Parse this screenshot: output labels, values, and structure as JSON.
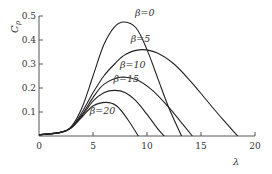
{
  "chart_data": {
    "type": "line",
    "title": "",
    "xlabel": "λ",
    "ylabel": "Cp",
    "ylabel_main": "C",
    "ylabel_sub": "p",
    "xlim": [
      0,
      20
    ],
    "ylim": [
      0,
      0.5
    ],
    "grid": false,
    "legend": "inline labels",
    "x_ticks": [
      0,
      5,
      10,
      15,
      20
    ],
    "x_tick_labels": [
      "0",
      "5",
      "10",
      "15",
      "20"
    ],
    "y_ticks": [
      0.1,
      0.2,
      0.3,
      0.4,
      0.5
    ],
    "y_tick_labels": [
      "0.1",
      "0.2",
      "0.3",
      "0.4",
      "0.5"
    ],
    "series": [
      {
        "name": "β=0",
        "label_pos": [
          8.9,
          0.5
        ],
        "x": [
          0,
          2,
          3,
          4,
          5,
          6,
          7,
          7.9,
          9,
          10,
          11,
          12,
          13.2
        ],
        "y": [
          0.005,
          0.015,
          0.04,
          0.12,
          0.25,
          0.38,
          0.455,
          0.475,
          0.45,
          0.36,
          0.24,
          0.12,
          0
        ]
      },
      {
        "name": "β=5",
        "label_pos": [
          8.5,
          0.39
        ],
        "x": [
          0,
          2,
          3,
          4,
          5,
          6,
          7,
          8,
          9.5,
          11,
          12.5,
          14,
          15.5,
          17,
          18.4
        ],
        "y": [
          0.005,
          0.015,
          0.035,
          0.1,
          0.18,
          0.25,
          0.3,
          0.34,
          0.36,
          0.345,
          0.3,
          0.23,
          0.15,
          0.07,
          0
        ]
      },
      {
        "name": "β=10",
        "label_pos": [
          7.5,
          0.285
        ],
        "x": [
          0,
          2,
          3,
          4,
          5,
          6,
          7.5,
          9,
          10.5,
          12,
          13.2,
          14.2
        ],
        "y": [
          0.005,
          0.015,
          0.035,
          0.09,
          0.16,
          0.215,
          0.245,
          0.235,
          0.19,
          0.12,
          0.055,
          0
        ]
      },
      {
        "name": "β=15",
        "label_pos": [
          6.9,
          0.225
        ],
        "x": [
          0,
          2,
          3,
          4,
          5,
          6,
          7,
          8,
          9,
          10,
          11,
          11.6
        ],
        "y": [
          0.005,
          0.015,
          0.035,
          0.085,
          0.145,
          0.18,
          0.19,
          0.18,
          0.145,
          0.09,
          0.03,
          0
        ]
      },
      {
        "name": "β=20",
        "label_pos": [
          4.7,
          0.09
        ],
        "x": [
          0,
          2,
          3,
          4,
          5,
          6.2,
          7.2,
          8.2,
          9.2
        ],
        "y": [
          0.005,
          0.015,
          0.035,
          0.08,
          0.125,
          0.14,
          0.125,
          0.07,
          0
        ]
      }
    ]
  },
  "plot_area": {
    "origin_px": [
      39,
      136
    ],
    "px_per_x": 10.8,
    "px_per_y": 240,
    "axis_color": "#555555",
    "curve_color": "#222222"
  }
}
